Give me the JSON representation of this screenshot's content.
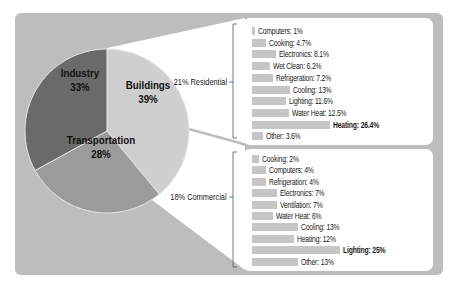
{
  "chart_data": [
    {
      "type": "pie",
      "title": "",
      "categories": [
        "Buildings",
        "Transportation",
        "Industry"
      ],
      "values": [
        39,
        28,
        33
      ],
      "labels": [
        "Buildings 39%",
        "Transportation 28%",
        "Industry 33%"
      ],
      "colors": [
        "#cfcfcf",
        "#9b9b9b",
        "#6a6a6a"
      ]
    },
    {
      "type": "bar",
      "orientation": "horizontal",
      "title": "21% Residential",
      "categories": [
        "Computers",
        "Cooking",
        "Electronics",
        "Wet Clean",
        "Refrigeration",
        "Cooling",
        "Lighting",
        "Water Heat",
        "Heating",
        "Other"
      ],
      "values": [
        1,
        4.7,
        8.1,
        6.2,
        7.2,
        13,
        11.6,
        12.5,
        26.4,
        3.6
      ],
      "unit": "%",
      "highlight": "Heating"
    },
    {
      "type": "bar",
      "orientation": "horizontal",
      "title": "18% Commercial",
      "categories": [
        "Cooking",
        "Computers",
        "Refrigeration",
        "Electronics",
        "Ventilation",
        "Water Heat",
        "Cooling",
        "Heating",
        "Lighting",
        "Other"
      ],
      "values": [
        2,
        4,
        4,
        7,
        7,
        6,
        13,
        12,
        25,
        13
      ],
      "unit": "%",
      "highlight": "Lighting"
    }
  ],
  "pie": {
    "slices": [
      {
        "name": "Buildings",
        "pct": "39%"
      },
      {
        "name": "Transportation",
        "pct": "28%"
      },
      {
        "name": "Industry",
        "pct": "33%"
      }
    ]
  },
  "residential": {
    "label": "21% Residential",
    "rows": [
      {
        "text": "Computers: 1%",
        "value": 1
      },
      {
        "text": "Cooking: 4.7%",
        "value": 4.7
      },
      {
        "text": "Electronics: 8.1%",
        "value": 8.1
      },
      {
        "text": "Wet Clean: 6.2%",
        "value": 6.2
      },
      {
        "text": "Refrigeration: 7.2%",
        "value": 7.2
      },
      {
        "text": "Cooling: 13%",
        "value": 13
      },
      {
        "text": "Lighting: 11.6%",
        "value": 11.6
      },
      {
        "text": "Water Heat: 12.5%",
        "value": 12.5
      },
      {
        "text": "Heating: 26.4%",
        "value": 26.4
      },
      {
        "text": "Other: 3.6%",
        "value": 3.6
      }
    ]
  },
  "commercial": {
    "label": "18% Commercial",
    "rows": [
      {
        "text": "Cooking: 2%",
        "value": 2
      },
      {
        "text": "Computers: 4%",
        "value": 4
      },
      {
        "text": "Refrigeration: 4%",
        "value": 4
      },
      {
        "text": "Electronics: 7%",
        "value": 7
      },
      {
        "text": "Ventilation: 7%",
        "value": 7
      },
      {
        "text": "Water Heat: 6%",
        "value": 6
      },
      {
        "text": "Cooling: 13%",
        "value": 13
      },
      {
        "text": "Heating: 12%",
        "value": 12
      },
      {
        "text": "Lighting: 25%",
        "value": 25
      },
      {
        "text": "Other: 13%",
        "value": 13
      }
    ]
  },
  "colors": {
    "background_panel": "#bdbdbd",
    "bar": "#c6c6c6",
    "callout": "#ffffff"
  }
}
